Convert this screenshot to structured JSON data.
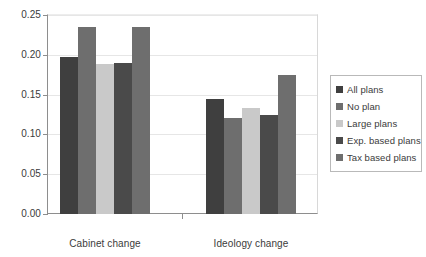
{
  "chart_data": {
    "type": "bar",
    "title": "",
    "xlabel": "",
    "ylabel": "",
    "categories": [
      "Cabinet change",
      "Ideology change"
    ],
    "series": [
      {
        "name": "All plans",
        "color": "#3f3f3f",
        "values": [
          0.197,
          0.145
        ]
      },
      {
        "name": "No plan",
        "color": "#6e6e6e",
        "values": [
          0.235,
          0.12
        ]
      },
      {
        "name": "Large plans",
        "color": "#c9c9c9",
        "values": [
          0.188,
          0.133
        ]
      },
      {
        "name": "Exp. based plans",
        "color": "#4a4a4a",
        "values": [
          0.19,
          0.125
        ]
      },
      {
        "name": "Tax based plans",
        "color": "#6e6e6e",
        "values": [
          0.235,
          0.175
        ]
      }
    ],
    "ylim": [
      0.0,
      0.25
    ],
    "ytick_labels": [
      "0.00",
      "0.05",
      "0.10",
      "0.15",
      "0.20",
      "0.25"
    ],
    "ytick_values": [
      0.0,
      0.05,
      0.1,
      0.15,
      0.2,
      0.25
    ],
    "grid": true,
    "legend_position": "right",
    "grid_color": "#e6e6e6",
    "axis_color": "#8e8e8e"
  }
}
